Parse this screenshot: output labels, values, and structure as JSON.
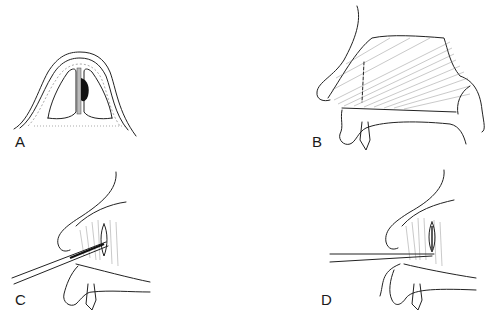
{
  "figure": {
    "panels": [
      {
        "id": "A",
        "label": "A",
        "description": "Coronal cross-section of the nose showing nasal septum with dark deviation/hematoma on the right side of the septum, surrounded by cartilage and soft tissue layers"
      },
      {
        "id": "B",
        "label": "B",
        "description": "Lateral view of the nose showing hatched septal cartilage region with dashed vertical incision line, maxillary bone and incisor below"
      },
      {
        "id": "C",
        "label": "C",
        "description": "Lateral view showing an instrument inserted through the nostril into the septal incision"
      },
      {
        "id": "D",
        "label": "D",
        "description": "Lateral view showing a double-bladed instrument inserted through the nostril with flap elevation at the septum"
      }
    ]
  },
  "colors": {
    "line": "#222222",
    "hatch": "#777777",
    "fill_dark": "#111111",
    "background": "#ffffff"
  }
}
